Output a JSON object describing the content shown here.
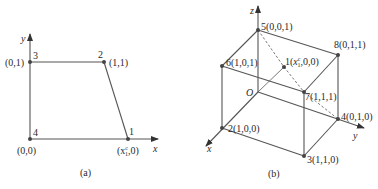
{
  "diagram_a": {
    "caption": "(a)",
    "axes": {
      "x": "x",
      "y": "y"
    },
    "nodes": [
      {
        "id": "1",
        "coord_prefix": "(x",
        "coord_sup": "c",
        "coord_sub": "1",
        "coord_suffix": ",0)"
      },
      {
        "id": "2",
        "coord": "(1,1)"
      },
      {
        "id": "3",
        "coord": "(0,1)"
      },
      {
        "id": "4",
        "coord": "(0,0)"
      }
    ]
  },
  "diagram_b": {
    "caption": "(b)",
    "axes": {
      "x": "x",
      "y": "y",
      "z": "z",
      "origin": "O"
    },
    "nodes": [
      {
        "id": "1",
        "label_prefix": "1(",
        "coord_sup": "c",
        "coord_sub": "1",
        "label_suffix": ",0,0)"
      },
      {
        "id": "2",
        "label": "2(1,0,0)"
      },
      {
        "id": "3",
        "label": "3(1,1,0)"
      },
      {
        "id": "4",
        "label": "4(0,1,0)"
      },
      {
        "id": "5",
        "label": "5(0,0,1)"
      },
      {
        "id": "6",
        "label": "6(1,0,1)"
      },
      {
        "id": "7",
        "label": "7(1,1,1)"
      },
      {
        "id": "8",
        "label": "8(0,1,1)"
      }
    ]
  },
  "colors": {
    "line": "#555555",
    "text": "#2a2a2a",
    "background": "#ffffff"
  }
}
